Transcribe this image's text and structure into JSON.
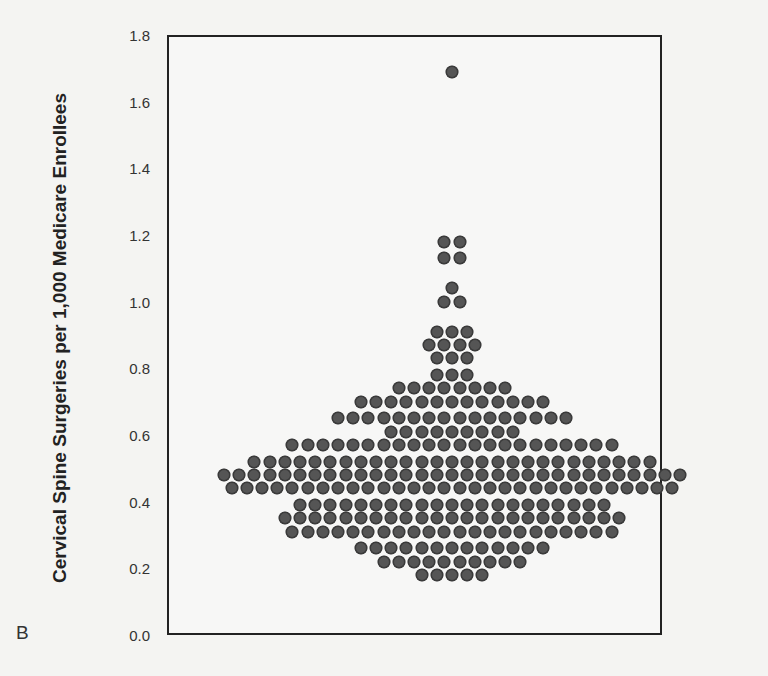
{
  "figure": {
    "panel_letter": "B",
    "ylabel": "Cervical Spine Surgeries per 1,000 Medicare Enrollees",
    "yticks": [
      "0.0",
      "0.2",
      "0.4",
      "0.6",
      "0.8",
      "1.0",
      "1.2",
      "1.4",
      "1.6",
      "1.8"
    ]
  },
  "chart_data": {
    "type": "scatter",
    "subtype": "dot-plot (beeswarm)",
    "title": "",
    "xlabel": "",
    "ylabel": "Cervical Spine Surgeries per 1,000 Medicare Enrollees",
    "ylim": [
      0.0,
      1.8
    ],
    "yticks": [
      0.0,
      0.2,
      0.4,
      0.6,
      0.8,
      1.0,
      1.2,
      1.4,
      1.6,
      1.8
    ],
    "grid": false,
    "legend": null,
    "dot_color": "#555555",
    "rows": [
      {
        "y": 1.69,
        "count": 1
      },
      {
        "y": 1.18,
        "count": 2
      },
      {
        "y": 1.13,
        "count": 2
      },
      {
        "y": 1.04,
        "count": 1
      },
      {
        "y": 1.0,
        "count": 2
      },
      {
        "y": 0.91,
        "count": 3
      },
      {
        "y": 0.87,
        "count": 4
      },
      {
        "y": 0.83,
        "count": 3
      },
      {
        "y": 0.78,
        "count": 3
      },
      {
        "y": 0.74,
        "count": 8
      },
      {
        "y": 0.7,
        "count": 13
      },
      {
        "y": 0.65,
        "count": 16
      },
      {
        "y": 0.61,
        "count": 9
      },
      {
        "y": 0.57,
        "count": 22
      },
      {
        "y": 0.52,
        "count": 27
      },
      {
        "y": 0.48,
        "count": 31
      },
      {
        "y": 0.44,
        "count": 30
      },
      {
        "y": 0.39,
        "count": 21
      },
      {
        "y": 0.35,
        "count": 23
      },
      {
        "y": 0.31,
        "count": 22
      },
      {
        "y": 0.26,
        "count": 13
      },
      {
        "y": 0.22,
        "count": 10
      },
      {
        "y": 0.18,
        "count": 5
      }
    ],
    "total_points": 271
  }
}
